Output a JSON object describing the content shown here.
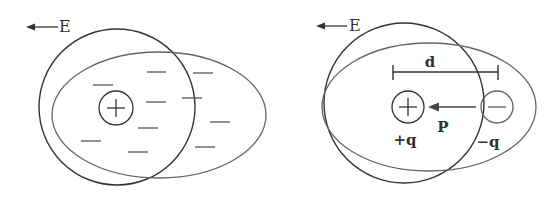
{
  "left_panel": {
    "field_label": "E",
    "center_charge_symbol": "+",
    "electron_cloud_dashes": "—"
  },
  "right_panel": {
    "field_label": "E",
    "separation_label": "d",
    "dipole_moment_label": "P",
    "positive_charge_label": "+q",
    "negative_charge_label": "−q"
  },
  "colors": {
    "stroke": "#3a3a3a",
    "ellipse_stroke": "#6a6a6a",
    "background": "#ffffff"
  }
}
